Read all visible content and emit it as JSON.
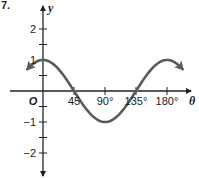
{
  "problem_number": "7.",
  "colors": {
    "axis": "#222222",
    "curve": "#5a5a5a",
    "text": "#222222"
  },
  "chart_data": {
    "type": "line",
    "title": "",
    "xlabel": "θ",
    "ylabel": "y",
    "origin_label": "O",
    "function": "y = cos(2θ)",
    "x_ticks": [
      {
        "value": 45,
        "label": "45"
      },
      {
        "value": 90,
        "label": "90°"
      },
      {
        "value": 135,
        "label": "135°"
      },
      {
        "value": 180,
        "label": "180°"
      }
    ],
    "y_ticks": [
      {
        "value": 2,
        "label": "2"
      },
      {
        "value": 1.5,
        "label": ""
      },
      {
        "value": 1,
        "label": "1"
      },
      {
        "value": 0.5,
        "label": ""
      },
      {
        "value": -0.5,
        "label": ""
      },
      {
        "value": -1,
        "label": "−1"
      },
      {
        "value": -1.5,
        "label": ""
      },
      {
        "value": -2,
        "label": "−2"
      }
    ],
    "xlim": [
      -22.5,
      202.5
    ],
    "ylim": [
      -2.8,
      2.4
    ],
    "series": [
      {
        "name": "cos 2θ",
        "x": [
          -22.5,
          0,
          22.5,
          45,
          67.5,
          90,
          112.5,
          135,
          157.5,
          180,
          202.5
        ],
        "y": [
          0.71,
          1,
          0.71,
          0,
          -0.71,
          -1,
          -0.71,
          0,
          0.71,
          1,
          0.71
        ],
        "arrows_both_ends": true
      }
    ],
    "grid": false
  }
}
